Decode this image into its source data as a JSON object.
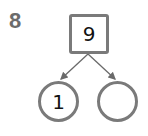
{
  "problem": {
    "number": "8",
    "whole": "9",
    "parts": [
      "1",
      ""
    ]
  },
  "colors": {
    "outline": "#7a7a7a",
    "number": "#6b6b6b"
  }
}
